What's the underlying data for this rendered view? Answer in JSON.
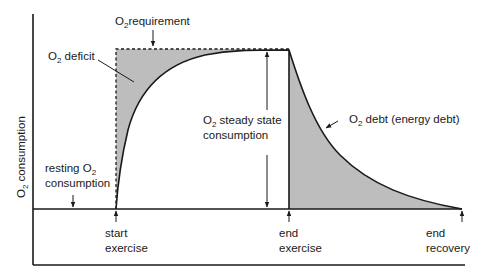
{
  "diagram": {
    "colors": {
      "ink": "#1a1a1a",
      "shade": "#bdbdbd",
      "background": "#ffffff"
    },
    "axes": {
      "y_label_prefix": "O",
      "y_label_sub": "2",
      "y_label_suffix": " consumption"
    },
    "labels": {
      "requirement": {
        "prefix": "O",
        "sub": "2",
        "suffix": "requirement"
      },
      "deficit": {
        "prefix": "O",
        "sub": "2",
        "suffix": " deficit"
      },
      "steady_state_line1": {
        "prefix": "O",
        "sub": "2",
        "suffix": " steady state"
      },
      "steady_state_line2": "consumption",
      "debt": {
        "prefix": "O",
        "sub": "2",
        "suffix": " debt (energy debt)"
      },
      "resting_line1": {
        "prefix": "resting O",
        "sub": "2"
      },
      "resting_line2": "consumption",
      "start_line1": "start",
      "start_line2": "exercise",
      "end_ex_line1": "end",
      "end_ex_line2": "exercise",
      "end_rec_line1": "end",
      "end_rec_line2": "recovery"
    },
    "regions": [
      {
        "name": "O2 deficit",
        "shaded": true
      },
      {
        "name": "O2 debt (energy debt)",
        "shaded": true
      }
    ],
    "events": [
      "start exercise",
      "end exercise",
      "end recovery"
    ]
  }
}
